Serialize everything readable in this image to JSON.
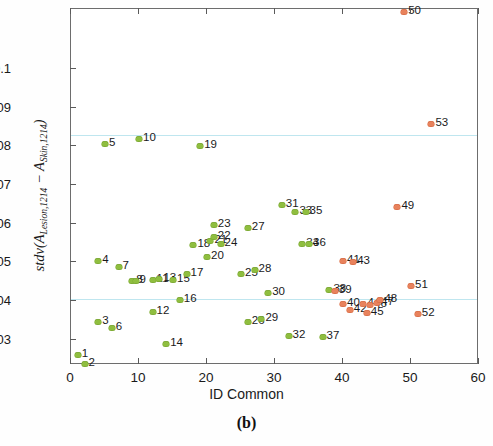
{
  "chart_data": {
    "type": "scatter",
    "title": "",
    "caption": "(b)",
    "xlabel": "ID Common",
    "ylabel": "stdv(A_Lesion,1214 - A_Skin,1214)",
    "ylabel_parts": {
      "fn": "stdv(",
      "a1": "A",
      "a1sub": "Lesion,1214",
      "minus": " − ",
      "a2": "A",
      "a2sub": "Skin,1214",
      "close": ")"
    },
    "xlim": [
      0,
      60
    ],
    "ylim": [
      0.0235,
      0.1155
    ],
    "xticks": [
      0,
      10,
      20,
      30,
      40,
      50,
      60
    ],
    "xtick_labels": [
      "0",
      "10",
      "20",
      "30",
      "40",
      "50",
      "60"
    ],
    "yticks": [
      0.03,
      0.04,
      0.05,
      0.06,
      0.07,
      0.08,
      0.09,
      0.1
    ],
    "ytick_labels": [
      "0.03",
      "0.04",
      "0.05",
      "0.06",
      "0.07",
      "0.08",
      "0.09",
      "0.1"
    ],
    "grid": false,
    "legend": "none",
    "reference_lines": [
      {
        "name": "upper-threshold",
        "y": 0.083,
        "color": "#bfe6ef"
      },
      {
        "name": "lower-threshold",
        "y": 0.0405,
        "color": "#bfe6ef"
      }
    ],
    "colors": {
      "green": "#8fbe3f",
      "red": "#e8825c",
      "refline": "#bfe6ef",
      "axis": "#6d6d6d"
    },
    "series": [
      {
        "name": "green-group",
        "color": "#8fbe3f",
        "points": [
          {
            "label": "1",
            "x": 1,
            "y": 0.0262
          },
          {
            "label": "2",
            "x": 2,
            "y": 0.0238
          },
          {
            "label": "3",
            "x": 4,
            "y": 0.0345
          },
          {
            "label": "4",
            "x": 4,
            "y": 0.0503
          },
          {
            "label": "5",
            "x": 5,
            "y": 0.0805
          },
          {
            "label": "6",
            "x": 6,
            "y": 0.033
          },
          {
            "label": "7",
            "x": 7,
            "y": 0.0487
          },
          {
            "label": "8",
            "x": 9,
            "y": 0.0452
          },
          {
            "label": "9",
            "x": 9.5,
            "y": 0.0452
          },
          {
            "label": "10",
            "x": 10,
            "y": 0.082
          },
          {
            "label": "11",
            "x": 12,
            "y": 0.0455
          },
          {
            "label": "12",
            "x": 12,
            "y": 0.0373
          },
          {
            "label": "13",
            "x": 13,
            "y": 0.0458
          },
          {
            "label": "14",
            "x": 14,
            "y": 0.0288
          },
          {
            "label": "15",
            "x": 15,
            "y": 0.0455
          },
          {
            "label": "16",
            "x": 16,
            "y": 0.0403
          },
          {
            "label": "17",
            "x": 17,
            "y": 0.047
          },
          {
            "label": "18",
            "x": 18,
            "y": 0.0545
          },
          {
            "label": "19",
            "x": 19,
            "y": 0.08
          },
          {
            "label": "20",
            "x": 20,
            "y": 0.0515
          },
          {
            "label": "21",
            "x": 20.5,
            "y": 0.0555
          },
          {
            "label": "22",
            "x": 21,
            "y": 0.0565
          },
          {
            "label": "23",
            "x": 21,
            "y": 0.0598
          },
          {
            "label": "24",
            "x": 22,
            "y": 0.0548
          },
          {
            "label": "25",
            "x": 25,
            "y": 0.047
          },
          {
            "label": "26",
            "x": 26,
            "y": 0.0345
          },
          {
            "label": "27",
            "x": 26,
            "y": 0.0588
          },
          {
            "label": "28",
            "x": 27,
            "y": 0.048
          },
          {
            "label": "29",
            "x": 28,
            "y": 0.0355
          },
          {
            "label": "30",
            "x": 29,
            "y": 0.042
          },
          {
            "label": "31",
            "x": 31,
            "y": 0.0648
          },
          {
            "label": "32",
            "x": 32,
            "y": 0.031
          },
          {
            "label": "33",
            "x": 33,
            "y": 0.063
          },
          {
            "label": "34",
            "x": 34,
            "y": 0.0548
          },
          {
            "label": "35",
            "x": 34.5,
            "y": 0.063
          },
          {
            "label": "36",
            "x": 35,
            "y": 0.0548
          },
          {
            "label": "37",
            "x": 37,
            "y": 0.0308
          },
          {
            "label": "38",
            "x": 38,
            "y": 0.0428
          }
        ]
      },
      {
        "name": "red-group",
        "color": "#e8825c",
        "points": [
          {
            "label": "39",
            "x": 38.8,
            "y": 0.0425
          },
          {
            "label": "40",
            "x": 40,
            "y": 0.0392
          },
          {
            "label": "41",
            "x": 40,
            "y": 0.0505
          },
          {
            "label": "42",
            "x": 41,
            "y": 0.0378
          },
          {
            "label": "43",
            "x": 41.5,
            "y": 0.05
          },
          {
            "label": "44",
            "x": 43,
            "y": 0.0392
          },
          {
            "label": "45",
            "x": 43.5,
            "y": 0.037
          },
          {
            "label": "46",
            "x": 44,
            "y": 0.039
          },
          {
            "label": "47",
            "x": 45,
            "y": 0.0395
          },
          {
            "label": "48",
            "x": 45.5,
            "y": 0.0403
          },
          {
            "label": "49",
            "x": 48,
            "y": 0.0643
          },
          {
            "label": "50",
            "x": 49,
            "y": 0.1148
          },
          {
            "label": "51",
            "x": 50,
            "y": 0.044
          },
          {
            "label": "52",
            "x": 51,
            "y": 0.0368
          },
          {
            "label": "53",
            "x": 53,
            "y": 0.0858
          }
        ]
      }
    ]
  }
}
